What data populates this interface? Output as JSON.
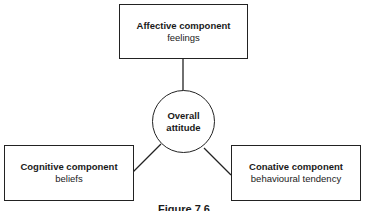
{
  "diagram": {
    "center": {
      "line1": "Overall",
      "line2": "attitude"
    },
    "top": {
      "title": "Affective component",
      "subtitle": "feelings"
    },
    "left": {
      "title": "Cognitive component",
      "subtitle": "beliefs"
    },
    "right": {
      "title": "Conative component",
      "subtitle": "behavioural tendency"
    },
    "caption": "Figure 7.6"
  }
}
